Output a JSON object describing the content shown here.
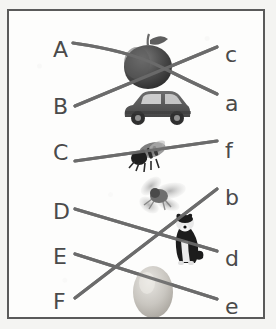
{
  "worksheet": {
    "title": "Matching exercise",
    "line_color": "#6b6b6b",
    "label_color": "#4a4a4a",
    "border_color": "#5a5a5a",
    "background_color": "#fdfdfc"
  },
  "left_labels": [
    {
      "id": "A",
      "text": "A",
      "x": 44,
      "y": 28
    },
    {
      "id": "B",
      "text": "B",
      "x": 44,
      "y": 85
    },
    {
      "id": "C",
      "text": "C",
      "x": 44,
      "y": 131
    },
    {
      "id": "D",
      "text": "D",
      "x": 44,
      "y": 190
    },
    {
      "id": "E",
      "text": "E",
      "x": 44,
      "y": 235
    },
    {
      "id": "F",
      "text": "F",
      "x": 44,
      "y": 280
    }
  ],
  "right_labels": [
    {
      "id": "c",
      "text": "c",
      "x": 216,
      "y": 33
    },
    {
      "id": "a",
      "text": "a",
      "x": 216,
      "y": 82
    },
    {
      "id": "f",
      "text": "f",
      "x": 216,
      "y": 129
    },
    {
      "id": "b",
      "text": "b",
      "x": 216,
      "y": 176
    },
    {
      "id": "d",
      "text": "d",
      "x": 216,
      "y": 237
    },
    {
      "id": "e",
      "text": "e",
      "x": 216,
      "y": 285
    }
  ],
  "pictures": [
    {
      "name": "apple-picture",
      "label": "apple",
      "x": 112,
      "y": 20,
      "w": 56,
      "h": 58
    },
    {
      "name": "car-picture",
      "label": "car",
      "x": 112,
      "y": 76,
      "w": 72,
      "h": 46
    },
    {
      "name": "bee-picture",
      "label": "bee",
      "x": 118,
      "y": 126,
      "w": 44,
      "h": 38
    },
    {
      "name": "fly-picture",
      "label": "fly",
      "x": 126,
      "y": 166,
      "w": 52,
      "h": 40
    },
    {
      "name": "dog-picture",
      "label": "dog",
      "x": 152,
      "y": 200,
      "w": 44,
      "h": 56
    },
    {
      "name": "egg-picture",
      "label": "egg",
      "x": 120,
      "y": 250,
      "w": 48,
      "h": 58
    }
  ],
  "connections": [
    {
      "from": "A",
      "to": "a",
      "path": "M 64 32 Q 120 40 150 55 T 208 83",
      "through": "apple"
    },
    {
      "from": "B",
      "to": "c",
      "path": "M 66 95 L 208 36",
      "through": "car"
    },
    {
      "from": "C",
      "to": "f",
      "path": "M 66 150 L 208 130",
      "through": "bee"
    },
    {
      "from": "D",
      "to": "d",
      "path": "M 66 198 L 208 240",
      "through": "dog"
    },
    {
      "from": "E",
      "to": "e",
      "path": "M 66 243 L 208 288",
      "through": "egg"
    },
    {
      "from": "F",
      "to": "b",
      "path": "M 66 287 L 208 178",
      "through": "fly"
    }
  ],
  "answer_key": [
    {
      "letter": "A",
      "picture": "apple",
      "match": "a"
    },
    {
      "letter": "B",
      "picture": "car",
      "match": "c"
    },
    {
      "letter": "C",
      "picture": "bee",
      "match": "f"
    },
    {
      "letter": "D",
      "picture": "dog",
      "match": "d"
    },
    {
      "letter": "E",
      "picture": "egg",
      "match": "e"
    },
    {
      "letter": "F",
      "picture": "fly",
      "match": "b"
    }
  ]
}
